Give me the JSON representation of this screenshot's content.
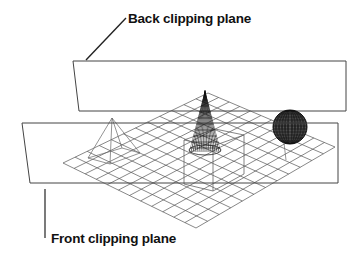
{
  "diagram": {
    "type": "3D view frustum clipping illustration",
    "labels": {
      "back": "Back clipping plane",
      "front": "Front clipping plane"
    },
    "objects": [
      "wireframe ground grid",
      "pyramid",
      "cone",
      "box",
      "sphere"
    ],
    "colors": {
      "background": "#ffffff",
      "line": "#333333",
      "text": "#111111"
    }
  }
}
